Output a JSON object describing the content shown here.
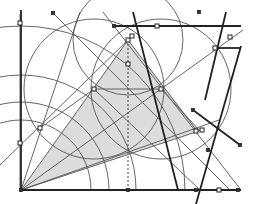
{
  "diagram": {
    "type": "geometric-construction",
    "colors": {
      "background": "#ffffff",
      "line": "#555555",
      "thick_line": "#222222",
      "shade": "#dcdcdc"
    },
    "origin": [
      21,
      190
    ],
    "shaded_triangle": [
      [
        21,
        190
      ],
      [
        128,
        40
      ],
      [
        199,
        131
      ]
    ],
    "axes": {
      "vertical": {
        "x": 21,
        "y_top": 10,
        "y_bottom": 190
      },
      "horizontal": {
        "y": 190,
        "x_left": 21,
        "x_right": 241
      }
    },
    "dashed_line": {
      "x": 128,
      "y_top": 40,
      "y_bottom": 190
    },
    "thick_lines": [
      {
        "from": [
          114,
          26
        ],
        "to": [
          241,
          26
        ]
      },
      {
        "from": [
          133,
          12
        ],
        "to": [
          178,
          190
        ]
      },
      {
        "from": [
          226,
          12
        ],
        "to": [
          205,
          100
        ]
      },
      {
        "from": [
          215,
          48
        ],
        "to": [
          241,
          48
        ]
      },
      {
        "from": [
          241,
          46
        ],
        "to": [
          196,
          204
        ]
      },
      {
        "from": [
          193,
          110
        ],
        "to": [
          240,
          145
        ]
      }
    ],
    "thin_lines": [
      {
        "from": [
          21,
          190
        ],
        "to": [
          80,
          12
        ]
      },
      {
        "from": [
          21,
          190
        ],
        "to": [
          128,
          40
        ]
      },
      {
        "from": [
          21,
          190
        ],
        "to": [
          161,
          89
        ]
      },
      {
        "from": [
          21,
          190
        ],
        "to": [
          199,
          131
        ]
      },
      {
        "from": [
          21,
          190
        ],
        "to": [
          219,
          120
        ]
      },
      {
        "from": [
          53,
          13
        ],
        "to": [
          230,
          190
        ]
      },
      {
        "from": [
          103,
          12
        ],
        "to": [
          241,
          190
        ]
      },
      {
        "from": [
          94,
          89
        ],
        "to": [
          161,
          89
        ]
      },
      {
        "from": [
          0,
          165
        ],
        "to": [
          128,
          40
        ]
      },
      {
        "from": [
          161,
          89
        ],
        "to": [
          243,
          30
        ]
      },
      {
        "from": [
          40,
          128
        ],
        "to": [
          94,
          89
        ]
      },
      {
        "from": [
          94,
          89
        ],
        "to": [
          200,
          190
        ]
      },
      {
        "from": [
          128,
          40
        ],
        "to": [
          197,
          131
        ]
      },
      {
        "from": [
          161,
          89
        ],
        "to": [
          200,
          131
        ]
      },
      {
        "from": [
          20,
          14
        ],
        "to": [
          20,
          190
        ]
      }
    ],
    "arcs": [
      {
        "cx": 21,
        "cy": 190,
        "r": 70
      },
      {
        "cx": 21,
        "cy": 190,
        "r": 88
      },
      {
        "cx": 21,
        "cy": 190,
        "r": 115
      },
      {
        "cx": 21,
        "cy": 190,
        "r": 164
      },
      {
        "cx": 128,
        "cy": 40,
        "r": 55
      },
      {
        "cx": 94,
        "cy": 89,
        "r": 70
      },
      {
        "cx": 161,
        "cy": 89,
        "r": 70
      }
    ],
    "open_points": [
      [
        20,
        23
      ],
      [
        128,
        40
      ],
      [
        128,
        64
      ],
      [
        94,
        89
      ],
      [
        161,
        89
      ],
      [
        20,
        143
      ],
      [
        40,
        128
      ],
      [
        157,
        26
      ],
      [
        215,
        48
      ],
      [
        230,
        37
      ],
      [
        132,
        36
      ],
      [
        196,
        131
      ],
      [
        202,
        130
      ],
      [
        219,
        190
      ]
    ],
    "solid_points": [
      [
        21,
        190
      ],
      [
        114,
        26
      ],
      [
        193,
        110
      ],
      [
        208,
        150
      ],
      [
        128,
        190
      ],
      [
        196,
        190
      ],
      [
        238,
        190
      ],
      [
        53,
        13
      ],
      [
        240,
        145
      ],
      [
        199,
        12
      ]
    ]
  }
}
